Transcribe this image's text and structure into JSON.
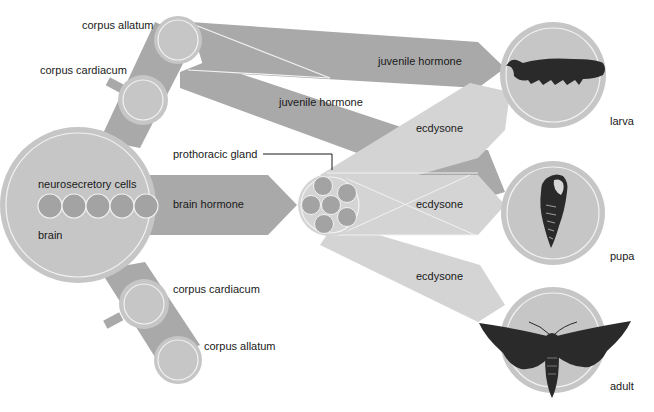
{
  "diagram": {
    "colors": {
      "background": "#ffffff",
      "dark_band": "#a9a9a9",
      "organ_fill": "#c6c6c6",
      "light_band": "#d4d4d4",
      "cell_fill": "#a3a3a3",
      "outline": "#f2f2f2",
      "text": "#1a1a1a",
      "insect": "#2a2a2a"
    },
    "labels": {
      "corpus_allatum_top": "corpus allatum",
      "corpus_cardiacum_top": "corpus cardiacum",
      "neurosecretory_cells": "neurosecretory cells",
      "brain": "brain",
      "brain_hormone": "brain hormone",
      "prothoracic_gland": "prothoracic gland",
      "juvenile_hormone_1": "juvenile hormone",
      "juvenile_hormone_2": "juvenile hormone",
      "ecdysone_1": "ecdysone",
      "ecdysone_2": "ecdysone",
      "ecdysone_3": "ecdysone",
      "corpus_cardiacum_bottom": "corpus cardiacum",
      "corpus_allatum_bottom": "corpus allatum",
      "larva": "larva",
      "pupa": "pupa",
      "adult": "adult"
    },
    "stages": [
      {
        "name": "larva",
        "icon": "caterpillar-icon"
      },
      {
        "name": "pupa",
        "icon": "chrysalis-icon"
      },
      {
        "name": "adult",
        "icon": "moth-icon"
      }
    ]
  }
}
